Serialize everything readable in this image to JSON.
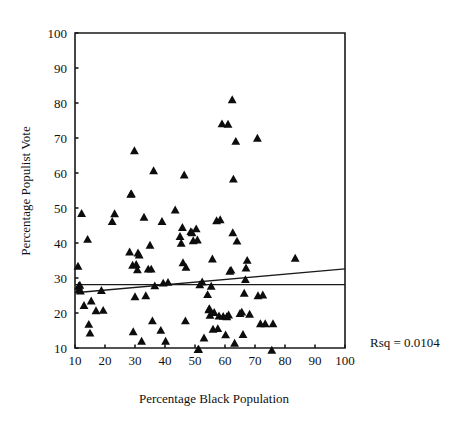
{
  "chart_data": {
    "type": "scatter",
    "title": "",
    "xlabel": "Percentage Black Population",
    "ylabel": "Percentage Populist Vote",
    "xlim": [
      10,
      100
    ],
    "ylim": [
      10,
      100
    ],
    "xticks": [
      10,
      20,
      30,
      40,
      50,
      60,
      70,
      80,
      90,
      100
    ],
    "yticks": [
      10,
      20,
      30,
      40,
      50,
      60,
      70,
      80,
      90,
      100
    ],
    "xtick_labels": [
      "10",
      "20",
      "30",
      "40",
      "50",
      "60",
      "70",
      "80",
      "90",
      "100"
    ],
    "ytick_labels": [
      "10",
      "20",
      "30",
      "40",
      "50",
      "60",
      "70",
      "80",
      "90",
      "100"
    ],
    "grid": false,
    "legend": null,
    "marker": "triangle",
    "marker_color": "#0d0d0d",
    "annotations": [
      {
        "text": "Rsq = 0.0104",
        "x": 370,
        "y": 343
      }
    ],
    "rsq": "0.0104",
    "fit_lines": [
      {
        "name": "regression-line",
        "x1": 10,
        "y1": 25.8,
        "x2": 100,
        "y2": 32.6
      },
      {
        "name": "mean-line",
        "x1": 10,
        "y1": 28.1,
        "x2": 100,
        "y2": 28.1
      }
    ],
    "points": [
      [
        11.0,
        33.3
      ],
      [
        11.2,
        27.6
      ],
      [
        11.4,
        26.8
      ],
      [
        11.6,
        27.9
      ],
      [
        11.8,
        26.2
      ],
      [
        12.2,
        48.4
      ],
      [
        13.0,
        22.1
      ],
      [
        14.2,
        41.0
      ],
      [
        14.6,
        16.7
      ],
      [
        15.0,
        14.2
      ],
      [
        15.4,
        23.4
      ],
      [
        17.0,
        20.6
      ],
      [
        18.8,
        26.4
      ],
      [
        19.4,
        20.7
      ],
      [
        22.4,
        46.1
      ],
      [
        23.2,
        48.3
      ],
      [
        28.2,
        37.4
      ],
      [
        28.6,
        53.9
      ],
      [
        28.8,
        54.0
      ],
      [
        29.2,
        33.6
      ],
      [
        29.4,
        14.6
      ],
      [
        29.8,
        66.3
      ],
      [
        30.0,
        24.6
      ],
      [
        30.4,
        33.8
      ],
      [
        30.8,
        32.3
      ],
      [
        31.0,
        37.1
      ],
      [
        31.4,
        36.5
      ],
      [
        32.2,
        11.9
      ],
      [
        33.0,
        47.3
      ],
      [
        33.6,
        24.9
      ],
      [
        34.4,
        32.5
      ],
      [
        35.0,
        39.3
      ],
      [
        35.4,
        32.5
      ],
      [
        35.8,
        17.7
      ],
      [
        36.2,
        60.6
      ],
      [
        36.6,
        27.7
      ],
      [
        38.6,
        15.0
      ],
      [
        39.0,
        46.1
      ],
      [
        39.4,
        28.5
      ],
      [
        40.2,
        11.9
      ],
      [
        41.0,
        28.7
      ],
      [
        43.4,
        49.4
      ],
      [
        45.0,
        41.8
      ],
      [
        45.4,
        39.9
      ],
      [
        45.8,
        44.4
      ],
      [
        46.0,
        34.3
      ],
      [
        46.4,
        59.4
      ],
      [
        46.8,
        17.7
      ],
      [
        47.0,
        33.0
      ],
      [
        48.6,
        43.2
      ],
      [
        49.0,
        42.9
      ],
      [
        49.4,
        40.6
      ],
      [
        50.4,
        44.0
      ],
      [
        50.8,
        40.8
      ],
      [
        51.0,
        9.5
      ],
      [
        51.2,
        9.6
      ],
      [
        51.6,
        28.0
      ],
      [
        52.4,
        28.8
      ],
      [
        53.0,
        12.8
      ],
      [
        54.2,
        25.2
      ],
      [
        54.6,
        20.9
      ],
      [
        54.8,
        21.2
      ],
      [
        55.0,
        19.3
      ],
      [
        55.4,
        27.6
      ],
      [
        55.8,
        35.4
      ],
      [
        56.0,
        15.3
      ],
      [
        56.4,
        20.1
      ],
      [
        57.2,
        46.3
      ],
      [
        57.6,
        15.5
      ],
      [
        58.0,
        19.1
      ],
      [
        58.4,
        46.6
      ],
      [
        59.0,
        74.0
      ],
      [
        59.4,
        19.0
      ],
      [
        60.2,
        13.7
      ],
      [
        60.6,
        18.9
      ],
      [
        61.0,
        73.9
      ],
      [
        61.2,
        19.4
      ],
      [
        61.6,
        31.9
      ],
      [
        62.0,
        32.2
      ],
      [
        62.4,
        80.9
      ],
      [
        62.6,
        42.9
      ],
      [
        62.8,
        58.2
      ],
      [
        63.2,
        11.3
      ],
      [
        63.6,
        69.0
      ],
      [
        64.0,
        40.5
      ],
      [
        65.0,
        19.8
      ],
      [
        65.6,
        20.2
      ],
      [
        66.0,
        13.8
      ],
      [
        66.4,
        25.6
      ],
      [
        66.8,
        29.5
      ],
      [
        67.0,
        32.8
      ],
      [
        67.4,
        35.0
      ],
      [
        68.2,
        19.6
      ],
      [
        70.8,
        69.9
      ],
      [
        71.0,
        24.9
      ],
      [
        71.8,
        16.9
      ],
      [
        72.6,
        25.1
      ],
      [
        73.4,
        16.9
      ],
      [
        75.6,
        9.3
      ],
      [
        76.0,
        16.9
      ],
      [
        83.4,
        35.6
      ]
    ]
  },
  "geometry": {
    "plot_left": 75,
    "plot_right": 345,
    "plot_top": 33,
    "plot_bottom": 348
  }
}
